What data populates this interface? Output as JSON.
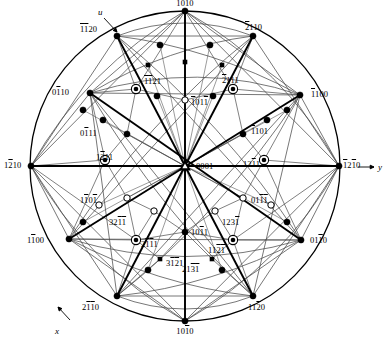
{
  "figure": {
    "kind": "stereographic-projection",
    "lattice": "hexagonal",
    "center_symbol": "triangle-3fold",
    "outer_circle": {
      "cx": 185,
      "cy": 166,
      "r": 155
    },
    "colors": {
      "ink": "#000000",
      "line": "#3a3a3a",
      "fill_pole": "#000000",
      "open_pole": "#ffffff"
    }
  },
  "axes": [
    {
      "name": "u-axis-label",
      "text": "u",
      "x": 98,
      "y": 8,
      "arrow": {
        "x1": 104,
        "y1": 18,
        "x2": 117,
        "y2": 32
      }
    },
    {
      "name": "x-axis-label",
      "text": "x",
      "x": 55,
      "y": 327,
      "arrow": {
        "x1": 70,
        "y1": 320,
        "x2": 58,
        "y2": 307
      }
    },
    {
      "name": "y-axis-label",
      "text": "y",
      "x": 378,
      "y": 163,
      "arrow": {
        "x1": 358,
        "y1": 167,
        "x2": 374,
        "y2": 167
      }
    }
  ],
  "poles": [
    {
      "id": "p0001",
      "label": "0001",
      "bars": [],
      "x": 185,
      "y": 166,
      "sym": "triangle",
      "lx": 196,
      "ly": 162,
      "anchor": "left"
    },
    {
      "id": "pb1010",
      "label": "1010",
      "bars": [
        0
      ],
      "x": 185,
      "y": 11,
      "sym": "filled",
      "lx": 185,
      "ly": -1,
      "anchor": "center"
    },
    {
      "id": "p1010b",
      "label": "1010",
      "bars": [
        2
      ],
      "x": 185,
      "y": 321,
      "sym": "filled",
      "lx": 185,
      "ly": 327,
      "anchor": "center"
    },
    {
      "id": "p0b110",
      "label": "0110",
      "bars": [
        1
      ],
      "x": 90,
      "y": 93,
      "sym": "filled",
      "lx": 52,
      "ly": 88,
      "anchor": "left"
    },
    {
      "id": "p01b10",
      "label": "0110",
      "bars": [
        2
      ],
      "x": 301,
      "y": 240,
      "sym": "filled",
      "lx": 310,
      "ly": 236,
      "anchor": "left"
    },
    {
      "id": "pb1100",
      "label": "1100",
      "bars": [
        0
      ],
      "x": 300,
      "y": 95,
      "sym": "filled",
      "lx": 311,
      "ly": 90,
      "anchor": "left"
    },
    {
      "id": "p1b100",
      "label": "1100",
      "bars": [
        1
      ],
      "x": 69,
      "y": 239,
      "sym": "filled",
      "lx": 27,
      "ly": 236,
      "anchor": "left"
    },
    {
      "id": "p12b10",
      "label": "1210",
      "bars": [
        1
      ],
      "x": 31,
      "y": 166,
      "sym": "filled",
      "lx": 4,
      "ly": 161,
      "anchor": "left"
    },
    {
      "id": "pb12b10",
      "label": "1210",
      "bars": [
        0,
        2
      ],
      "x": 339,
      "y": 166,
      "sym": "filled",
      "lx": 343,
      "ly": 161,
      "anchor": "left"
    },
    {
      "id": "pbb1120",
      "label": "1120",
      "bars": [
        0,
        1
      ],
      "x": 117,
      "y": 36,
      "sym": "filled",
      "lx": 80,
      "ly": 25,
      "anchor": "left"
    },
    {
      "id": "pb2110",
      "label": "2110",
      "bars": [
        0
      ],
      "x": 253,
      "y": 36,
      "sym": "filled",
      "lx": 245,
      "ly": 23,
      "anchor": "left"
    },
    {
      "id": "p2bb110",
      "label": "2110",
      "bars": [
        1,
        2
      ],
      "x": 117,
      "y": 296,
      "sym": "filled",
      "lx": 82,
      "ly": 303,
      "anchor": "left"
    },
    {
      "id": "p11b20",
      "label": "1120",
      "bars": [
        2
      ],
      "x": 253,
      "y": 296,
      "sym": "filled",
      "lx": 248,
      "ly": 303,
      "anchor": "left"
    },
    {
      "id": "pbb1121",
      "label": "1121",
      "bars": [
        0,
        1
      ],
      "x": 136,
      "y": 89,
      "sym": "ringdot",
      "lx": 144,
      "ly": 77,
      "anchor": "left"
    },
    {
      "id": "pb2111",
      "label": "2111",
      "bars": [
        0
      ],
      "x": 233,
      "y": 89,
      "sym": "ringdot",
      "lx": 222,
      "ly": 76,
      "anchor": "left"
    },
    {
      "id": "p1b211",
      "label": "1211",
      "bars": [
        1
      ],
      "x": 105,
      "y": 160,
      "sym": "ringdot",
      "lx": 96,
      "ly": 153,
      "anchor": "left"
    },
    {
      "id": "p12b11",
      "label": "1211",
      "bars": [
        2
      ],
      "x": 264,
      "y": 160,
      "sym": "ringdot",
      "lx": 243,
      "ly": 160,
      "anchor": "left"
    },
    {
      "id": "p2b1b11",
      "label": "2111",
      "bars": [
        1,
        2
      ],
      "x": 136,
      "y": 240,
      "sym": "ringdot",
      "lx": 141,
      "ly": 240,
      "anchor": "left"
    },
    {
      "id": "p11b2b1",
      "label": "1121",
      "bars": [
        2,
        3
      ],
      "x": 233,
      "y": 240,
      "sym": "ringdot",
      "lx": 208,
      "ly": 246,
      "anchor": "left"
    },
    {
      "id": "pb101b1",
      "label": "1011",
      "bars": [
        0,
        3
      ],
      "x": 185,
      "y": 100,
      "sym": "open",
      "lx": 191,
      "ly": 98,
      "anchor": "left"
    },
    {
      "id": "p101b1",
      "label": "1011",
      "bars": [
        2
      ],
      "x": 185,
      "y": 232,
      "sym": "filled",
      "lx": 191,
      "ly": 228,
      "anchor": "left"
    },
    {
      "id": "p0b111",
      "label": "0111",
      "bars": [
        1
      ],
      "x": 127,
      "y": 134,
      "sym": "filled",
      "lx": 80,
      "ly": 129,
      "anchor": "left"
    },
    {
      "id": "pb1101",
      "label": "1101",
      "bars": [
        0
      ],
      "x": 243,
      "y": 134,
      "sym": "filled",
      "lx": 251,
      "ly": 127,
      "anchor": "left"
    },
    {
      "id": "p1b10b1",
      "label": "1101",
      "bars": [
        1,
        3
      ],
      "x": 127,
      "y": 198,
      "sym": "open",
      "lx": 80,
      "ly": 196,
      "anchor": "left"
    },
    {
      "id": "p01bb11",
      "label": "0111",
      "bars": [
        2,
        3
      ],
      "x": 243,
      "y": 198,
      "sym": "open",
      "lx": 251,
      "ly": 196,
      "anchor": "left"
    },
    {
      "id": "p32b1b1",
      "label": "3211",
      "bars": [
        2,
        3
      ],
      "x": 154,
      "y": 211,
      "sym": "open",
      "lx": 109,
      "ly": 218,
      "anchor": "left"
    },
    {
      "id": "p123b1",
      "label": "1231",
      "bars": [
        3
      ],
      "x": 215,
      "y": 211,
      "sym": "open",
      "lx": 222,
      "ly": 218,
      "anchor": "left"
    },
    {
      "id": "p3b1b21",
      "label": "3121",
      "bars": [
        1,
        2
      ],
      "x": 160,
      "y": 259,
      "sym": "smallsq",
      "lx": 166,
      "ly": 259,
      "anchor": "left"
    },
    {
      "id": "p21b3b1",
      "label": "2131",
      "bars": [
        2,
        3
      ],
      "x": 212,
      "y": 259,
      "sym": "smallsq",
      "lx": 182,
      "ly": 265,
      "anchor": "left"
    }
  ],
  "plain_nodes": [
    {
      "x": 160,
      "y": 45,
      "sym": "filled"
    },
    {
      "x": 210,
      "y": 45,
      "sym": "filled"
    },
    {
      "x": 157,
      "y": 96,
      "sym": "filled"
    },
    {
      "x": 213,
      "y": 96,
      "sym": "filled"
    },
    {
      "x": 185,
      "y": 62,
      "sym": "smallsq"
    },
    {
      "x": 148,
      "y": 65,
      "sym": "smallsq"
    },
    {
      "x": 222,
      "y": 65,
      "sym": "smallsq"
    },
    {
      "x": 103,
      "y": 120,
      "sym": "filled"
    },
    {
      "x": 267,
      "y": 120,
      "sym": "filled"
    },
    {
      "x": 99,
      "y": 205,
      "sym": "open"
    },
    {
      "x": 271,
      "y": 205,
      "sym": "open"
    },
    {
      "x": 148,
      "y": 270,
      "sym": "filled"
    },
    {
      "x": 222,
      "y": 270,
      "sym": "filled"
    },
    {
      "x": 287,
      "y": 222,
      "sym": "filled"
    },
    {
      "x": 83,
      "y": 222,
      "sym": "filled"
    },
    {
      "x": 287,
      "y": 110,
      "sym": "filled"
    },
    {
      "x": 83,
      "y": 110,
      "sym": "filled"
    }
  ],
  "caption": {
    "visible": false,
    "text": ""
  }
}
